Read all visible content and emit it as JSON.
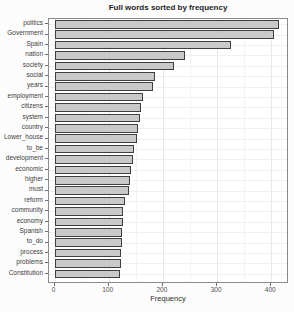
{
  "chart_data": {
    "type": "bar",
    "orientation": "horizontal",
    "title": "Full words sorted by frequency",
    "xlabel": "Frequency",
    "ylabel": "",
    "categories": [
      "politics",
      "Government",
      "Spain",
      "nation",
      "society",
      "social",
      "years",
      "employment",
      "citizens",
      "system",
      "country",
      "Lower_house",
      "to_be",
      "development",
      "economic",
      "higher",
      "must",
      "reform",
      "community",
      "economy",
      "Spanish",
      "to_do",
      "process",
      "problems",
      "Constitution"
    ],
    "values": [
      415,
      405,
      325,
      240,
      220,
      186,
      181,
      164,
      159,
      157,
      154,
      152,
      146,
      144,
      142,
      140,
      137,
      130,
      127,
      126,
      125,
      124,
      123,
      122,
      121
    ],
    "x_ticks": [
      0,
      100,
      200,
      300,
      400
    ],
    "x_minor_step": 50,
    "xlim": [
      0,
      440
    ],
    "grid": true,
    "legend": "none",
    "colors": {
      "bar_fill": "#c9c9c9",
      "bar_border": "#3f3f3f",
      "panel_border": "#8a8a8a",
      "grid_major": "#e7e7e7",
      "grid_minor": "#f3f3f3",
      "title_text": "#1c1c1c",
      "axis_text": "#4f4f4f"
    }
  }
}
